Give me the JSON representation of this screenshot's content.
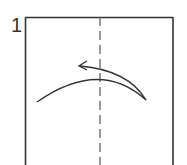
{
  "diagram": {
    "step_number": "1",
    "paper": {
      "stroke": "#333333",
      "fill": "#ffffff"
    },
    "fold_line": {
      "type": "valley-fold",
      "style": "dashed",
      "stroke": "#555555"
    },
    "arrow": {
      "direction": "right-to-left",
      "meaning": "fold right half over to the left"
    }
  }
}
